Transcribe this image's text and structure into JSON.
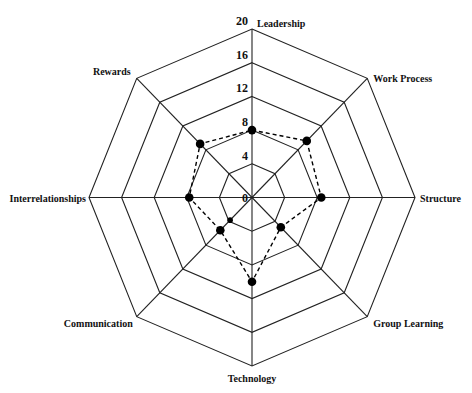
{
  "chart_data": {
    "type": "radar",
    "title": "",
    "categories": [
      "Leadership",
      "Work Process",
      "Structure",
      "Group Learning",
      "Technology",
      "Communication",
      "Interrelationships",
      "Rewards"
    ],
    "series": [
      {
        "name": "Score",
        "values": [
          8,
          9.5,
          8.5,
          5,
          10,
          5.5,
          7.7,
          9
        ],
        "line_style": "dashed",
        "marker": "filled-circle",
        "color": "#000000"
      }
    ],
    "extra_points": [
      {
        "axis": "Communication",
        "value": 3.8,
        "marker": "small-filled-circle"
      }
    ],
    "r_ticks": [
      0,
      4,
      8,
      12,
      16,
      20
    ],
    "r_range": [
      0,
      20
    ],
    "grid": "octagon",
    "legend": null
  },
  "labels": {
    "axes": [
      "Leadership",
      "Work Process",
      "Structure",
      "Group Learning",
      "Technology",
      "Communication",
      "Interrelationships",
      "Rewards"
    ],
    "ticks": [
      "0",
      "4",
      "8",
      "12",
      "16",
      "20"
    ]
  },
  "colors": {
    "grid": "#222222",
    "series": "#000000",
    "background": "#ffffff"
  }
}
